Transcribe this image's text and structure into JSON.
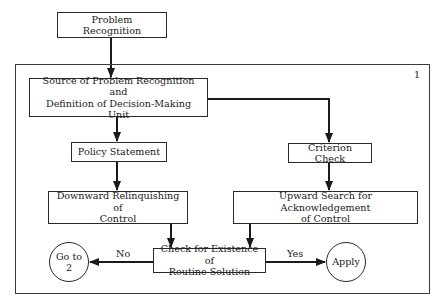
{
  "diagram": {
    "type": "flowchart",
    "frame_number": "1",
    "nodes": {
      "problem_recognition": {
        "label": "Problem Recognition",
        "shape": "rectangle"
      },
      "source": {
        "label_line1": "Source of Problem Recognition and",
        "label_line2": "Definition of Decision-Making Unit",
        "shape": "rectangle"
      },
      "policy_statement": {
        "label": "Policy Statement",
        "shape": "rectangle"
      },
      "criterion_check": {
        "label": "Criterion Check",
        "shape": "rectangle"
      },
      "downward": {
        "label_line1": "Downward Relinquishing of",
        "label_line2": "Control",
        "shape": "rectangle"
      },
      "upward": {
        "label_line1": "Upward Search for Acknowledgement",
        "label_line2": "of Control",
        "shape": "rectangle"
      },
      "check_routine": {
        "label_line1": "Check for Existence of",
        "label_line2": "Routine Solution",
        "shape": "rectangle"
      },
      "goto2": {
        "label_line1": "Go to",
        "label_line2": "2",
        "shape": "circle"
      },
      "apply": {
        "label": "Apply",
        "shape": "circle"
      }
    },
    "edges": [
      {
        "from": "problem_recognition",
        "to": "source",
        "label": ""
      },
      {
        "from": "source",
        "to": "policy_statement",
        "label": ""
      },
      {
        "from": "source",
        "to": "criterion_check",
        "label": ""
      },
      {
        "from": "policy_statement",
        "to": "downward",
        "label": ""
      },
      {
        "from": "criterion_check",
        "to": "upward",
        "label": ""
      },
      {
        "from": "downward",
        "to": "check_routine",
        "label": ""
      },
      {
        "from": "upward",
        "to": "check_routine",
        "label": ""
      },
      {
        "from": "check_routine",
        "to": "goto2",
        "label": "No"
      },
      {
        "from": "check_routine",
        "to": "apply",
        "label": "Yes"
      }
    ],
    "edge_labels": {
      "no": "No",
      "yes": "Yes"
    },
    "colors": {
      "line": "#2a2a2a",
      "background": "#ffffff"
    }
  }
}
